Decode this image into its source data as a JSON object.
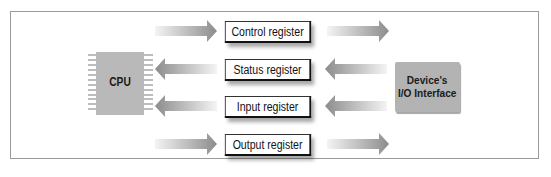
{
  "diagram": {
    "cpu": {
      "label": "CPU",
      "icon": "chip-icon"
    },
    "device": {
      "line1": "Device's",
      "line2": "I/O Interface"
    },
    "registers": [
      {
        "label": "Control register",
        "direction": "cpu-to-device"
      },
      {
        "label": "Status register",
        "direction": "device-to-cpu"
      },
      {
        "label": "Input register",
        "direction": "device-to-cpu"
      },
      {
        "label": "Output register",
        "direction": "cpu-to-device"
      }
    ],
    "colors": {
      "chip_fill": "#b9b9b9",
      "device_fill": "#b3b3b3",
      "arrow_dark": "#8c8c8c",
      "arrow_light": "#f4f4f4",
      "frame_border": "#9a9a9a"
    }
  }
}
